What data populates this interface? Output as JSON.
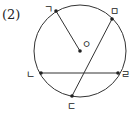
{
  "problem_label": "(2)",
  "circle": {
    "center_label": "ㅇ",
    "cx": 80,
    "cy": 51,
    "r": 46
  },
  "points": {
    "g": {
      "label": "ㄱ",
      "x": 56,
      "y": 11
    },
    "m": {
      "label": "ㅁ",
      "x": 112,
      "y": 19
    },
    "o": {
      "label": "ㅇ",
      "x": 80,
      "y": 51
    },
    "n": {
      "label": "ㄴ",
      "x": 41,
      "y": 73
    },
    "r": {
      "label": "ㄹ",
      "x": 118,
      "y": 73
    },
    "d": {
      "label": "ㄷ",
      "x": 72,
      "y": 96
    }
  },
  "segments": [
    {
      "from": "ㄱ",
      "to": "ㅇ",
      "type": "radius"
    },
    {
      "from": "ㅁ",
      "to": "ㄷ",
      "type": "chord"
    },
    {
      "from": "ㄴ",
      "to": "ㄹ",
      "type": "chord"
    }
  ],
  "colors": {
    "stroke": "#333333",
    "point": "#222222"
  }
}
